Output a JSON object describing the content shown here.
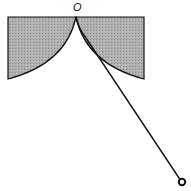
{
  "diagram": {
    "labels": {
      "origin": "O"
    },
    "colors": {
      "shade": "#a8a8a8",
      "line": "#111111",
      "background": "#ffffff"
    }
  }
}
